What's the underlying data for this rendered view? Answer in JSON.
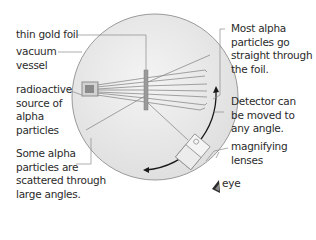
{
  "labels": {
    "gold_foil": "thin gold foil",
    "vacuum_vessel": "vacuum\nvessel",
    "source": "radioactive\nsource of\nalpha\nparticles",
    "scattered": "Some alpha\nparticles are\nscattered through\nlarge angles.",
    "straight": "Most alpha\nparticles go\nstraight through\nthe foil.",
    "detector": "Detector can\nbe moved to\nany angle.",
    "lenses": "magnifying\nlenses",
    "eye": "eye"
  },
  "colors": {
    "vessel_fill": "#e8e8e8",
    "vessel_stroke": "#9a9a9a",
    "beam": "#8c8c8c",
    "leader": "#8a8a8a",
    "arrow": "#1a1a1a",
    "text": "#2b2b2b"
  }
}
